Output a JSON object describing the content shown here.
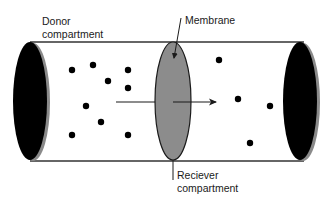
{
  "diagram": {
    "labels": {
      "donor_line1": "Donor",
      "donor_line2": "compartment",
      "membrane": "Membrane",
      "receiver_line1": "Reciever",
      "receiver_line2": "compartment"
    },
    "colors": {
      "tube_line": "#333333",
      "end_cap": "#000000",
      "end_cap_shadow": "#8a8a8a",
      "membrane_fill": "#8c8c8c",
      "particle": "#000000",
      "arrow": "#1a1a1a"
    },
    "particles": {
      "donor_count": 9,
      "receiver_count": 4
    },
    "flow_direction": "left-to-right"
  }
}
